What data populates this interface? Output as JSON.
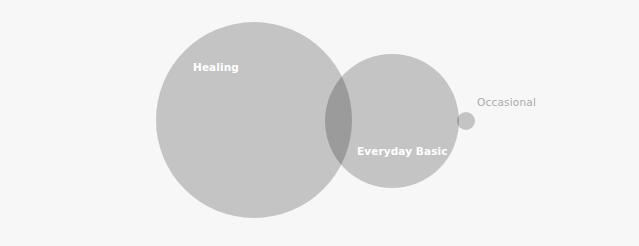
{
  "diagram": {
    "type": "venn",
    "colors": {
      "background": "#f7f7f7",
      "circle_fill": "#c4c4c4",
      "overlap_fill": "#9b9b9b",
      "inside_label": "#ffffff",
      "outside_label": "#aaaaaa"
    },
    "sets": [
      {
        "id": "healing",
        "label": "Healing",
        "cx": 254,
        "cy": 120,
        "r": 98
      },
      {
        "id": "everyday-basic",
        "label": "Everyday Basic",
        "cx": 392,
        "cy": 121,
        "r": 67
      },
      {
        "id": "occasional",
        "label": "Occasional",
        "cx": 466,
        "cy": 121,
        "r": 9
      }
    ]
  }
}
